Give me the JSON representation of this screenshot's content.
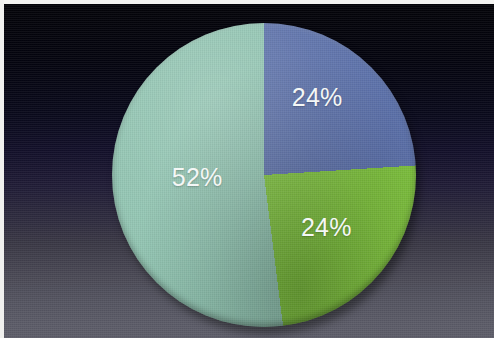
{
  "figure": {
    "name": "pie-chart-photo",
    "width": 494,
    "height": 338,
    "background_top_color": "#040409",
    "background_bottom_color": "#5e5e6a",
    "border_color": "#f2f2f0"
  },
  "chart_data": {
    "type": "pie",
    "title": "",
    "subtitle": "",
    "xlabel": "",
    "ylabel": "",
    "grid": false,
    "legend": "none",
    "start_angle_deg": 0,
    "direction": "clockwise",
    "total": 100,
    "unit": "%",
    "categories": [
      "Blue",
      "Green",
      "Teal"
    ],
    "values": [
      24,
      24,
      52
    ],
    "labels": [
      "24%",
      "24%",
      "52%"
    ],
    "colors": [
      "#5d72ab",
      "#80c440",
      "#92c5b2"
    ],
    "slices": [
      {
        "name": "blue-slice",
        "label": "24%",
        "value": 24,
        "color": "#5d72ab",
        "start_deg": 0,
        "end_deg": 86.4,
        "label_x_pct": 67.5,
        "label_y_pct": 24.5
      },
      {
        "name": "green-slice",
        "label": "24%",
        "value": 24,
        "color": "#80c440",
        "start_deg": 86.4,
        "end_deg": 172.8,
        "label_x_pct": 70.5,
        "label_y_pct": 67.0
      },
      {
        "name": "teal-slice",
        "label": "52%",
        "value": 52,
        "color": "#92c5b2",
        "start_deg": 172.8,
        "end_deg": 360,
        "label_x_pct": 28.0,
        "label_y_pct": 50.5
      }
    ]
  },
  "geometry": {
    "pie_left": 112,
    "pie_top": 23,
    "pie_size": 304,
    "label_font_size": 25,
    "label_color": "#f4f7f6"
  }
}
